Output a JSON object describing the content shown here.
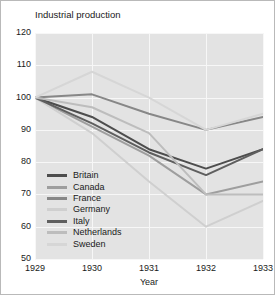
{
  "chart_data": {
    "type": "line",
    "title": "Industrial production",
    "xlabel": "Year",
    "ylabel": "",
    "x": [
      1929,
      1930,
      1931,
      1932,
      1933
    ],
    "xlim": [
      1929,
      1933
    ],
    "ylim": [
      50,
      120
    ],
    "yticks": [
      50,
      60,
      70,
      80,
      90,
      100,
      110,
      120
    ],
    "xticks": [
      "1929",
      "1930",
      "1931",
      "1932",
      "1933"
    ],
    "grid": true,
    "legend_position": "lower-left-inside",
    "series": [
      {
        "name": "Britain",
        "color": "#4d4d4d",
        "values": [
          100,
          94,
          84,
          78,
          84
        ]
      },
      {
        "name": "Canada",
        "color": "#9e9e9e",
        "values": [
          100,
          91,
          82,
          70,
          74
        ]
      },
      {
        "name": "France",
        "color": "#878787",
        "values": [
          100,
          101,
          95,
          90,
          94
        ]
      },
      {
        "name": "Germany",
        "color": "#cfcfcf",
        "values": [
          100,
          89,
          74,
          60,
          68
        ]
      },
      {
        "name": "Italy",
        "color": "#5f5f5f",
        "values": [
          100,
          92,
          83,
          76,
          84
        ]
      },
      {
        "name": "Netherlands",
        "color": "#bdbdbd",
        "values": [
          100,
          97,
          89,
          70,
          70
        ]
      },
      {
        "name": "Sweden",
        "color": "#d6d6d6",
        "values": [
          100,
          108,
          100,
          90,
          95
        ]
      }
    ]
  }
}
